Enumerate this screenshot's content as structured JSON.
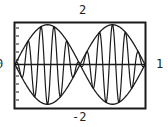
{
  "labels": {
    "top": "2",
    "bottom": "-2",
    "left": "0",
    "right": "1"
  },
  "colors": {
    "line": "#1a1a1a",
    "frame": "#1a1a1a",
    "background": "#ffffff"
  },
  "chart_data": {
    "type": "line",
    "title": "",
    "xlabel": "",
    "ylabel": "",
    "xlim": [
      0,
      1
    ],
    "ylim": [
      -2,
      2
    ],
    "tick_labels": {
      "x_min": "0",
      "x_max": "1",
      "y_min": "-2",
      "y_max": "2"
    },
    "grid": false,
    "legend": null,
    "series": [
      {
        "name": "upper envelope",
        "expression": "y = 1.85*|sin(pi*x*2)| style envelope",
        "description": "sin(2*pi*x) scaled"
      },
      {
        "name": "lower envelope",
        "description": "-sin(2*pi*x) scaled"
      },
      {
        "name": "modulated signal",
        "description": "sin(2*pi*x)*cos(2*pi*10*x), ~10 carrier cycles over [0,1]"
      },
      {
        "name": "zero axis",
        "description": "horizontal line y=0"
      }
    ],
    "envelope_amplitude": 1.85,
    "carrier_cycles": 10,
    "envelope_cycles": 1
  }
}
